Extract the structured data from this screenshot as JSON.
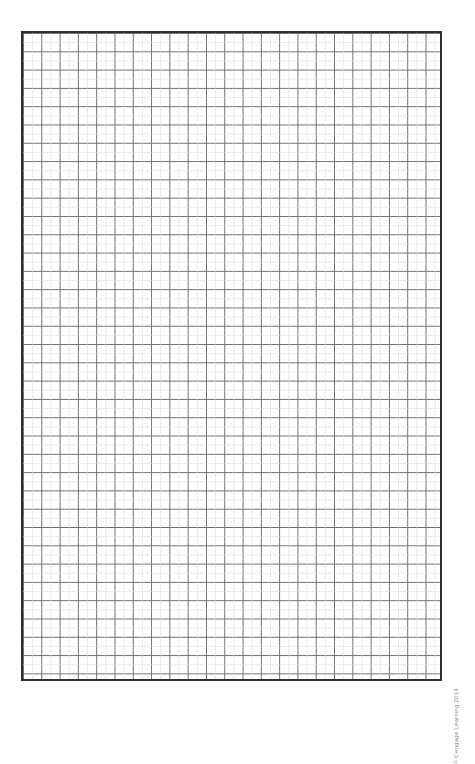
{
  "page": {
    "background_color": "#ffffff",
    "width_px": 475,
    "height_px": 710
  },
  "grid": {
    "name": "graph-paper-grid",
    "border_color": "#2e2e2e",
    "border_width_px": 2,
    "line_color": "#6f6f6f",
    "faint_line_color": "#d8d8d8",
    "cell_size_px": 18.3,
    "columns": 23,
    "rows": 35,
    "left_px": 21,
    "top_px": 31,
    "width_px": 421,
    "height_px": 650
  },
  "credit": {
    "text": "© Cengage Learning 2014",
    "color": "#8a8a8a",
    "rotation_deg": -90
  },
  "chart_data": {
    "type": "table",
    "title": "",
    "subtitle": "",
    "xlabel": "",
    "ylabel": "",
    "categories": [],
    "values": [],
    "grid": true,
    "legend": "none",
    "annotations": [
      "© Cengage Learning 2014"
    ]
  }
}
